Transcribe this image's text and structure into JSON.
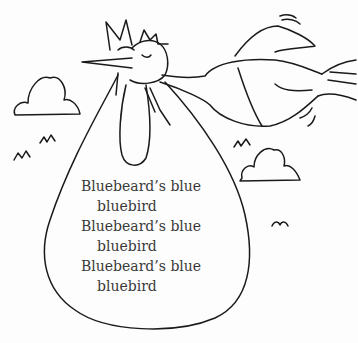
{
  "illustration": {
    "description": "Line drawing of a flying bird carrying a large bundle in its beak, with clouds and small grass tufts",
    "stroke_color": "#1a1a1a",
    "background": "#fdfdfd"
  },
  "bundle_text": {
    "lines": [
      "Bluebeard’s blue",
      "bluebird",
      "Bluebeard’s blue",
      "bluebird",
      "Bluebeard’s blue",
      "bluebird"
    ]
  }
}
